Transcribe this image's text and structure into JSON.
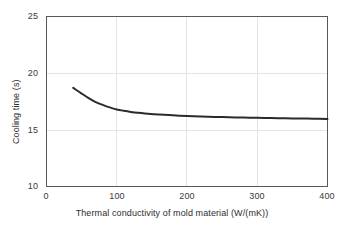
{
  "chart_data": {
    "type": "line",
    "title": "",
    "xlabel": "Thermal conductivity of mold material (W/(mK))",
    "ylabel": "Cooling time (s)",
    "xlim": [
      0,
      400
    ],
    "ylim": [
      10,
      25
    ],
    "xticks": [
      0,
      100,
      200,
      300,
      400
    ],
    "xtick_labels": [
      "0",
      "100",
      "200",
      "300",
      "400"
    ],
    "yticks": [
      10,
      15,
      20,
      25
    ],
    "ytick_labels": [
      "10",
      "15",
      "20",
      "25"
    ],
    "grid": true,
    "legend": null,
    "line_color": "#2b2b2b",
    "grid_color": "#e2e2e2",
    "axis_color": "#58585a",
    "series": [
      {
        "name": "Cooling time",
        "x": [
          38,
          50,
          60,
          70,
          80,
          90,
          100,
          110,
          120,
          130,
          140,
          160,
          180,
          200,
          220,
          240,
          260,
          280,
          300,
          320,
          340,
          360,
          380,
          400
        ],
        "y": [
          18.7,
          18.2,
          17.8,
          17.45,
          17.2,
          16.98,
          16.8,
          16.68,
          16.58,
          16.5,
          16.44,
          16.35,
          16.28,
          16.22,
          16.18,
          16.14,
          16.11,
          16.08,
          16.06,
          16.04,
          16.02,
          16.0,
          15.98,
          15.96
        ]
      }
    ]
  },
  "axes": {
    "ytick_positions": [
      {
        "label": "25",
        "top": 12
      },
      {
        "label": "20",
        "top": 69
      },
      {
        "label": "15",
        "top": 126
      },
      {
        "label": "10",
        "top": 182
      }
    ],
    "xtick_positions": [
      {
        "label": "0",
        "left": 31
      },
      {
        "label": "100",
        "left": 102
      },
      {
        "label": "200",
        "left": 172
      },
      {
        "label": "300",
        "left": 242
      },
      {
        "label": "400",
        "left": 312
      }
    ]
  }
}
